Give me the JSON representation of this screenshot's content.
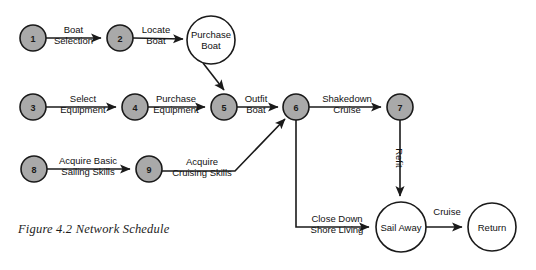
{
  "figure": {
    "caption": "Figure 4.2 Network Schedule",
    "colors": {
      "node_fill_gray": "#a9a9a9",
      "node_fill_white": "#ffffff",
      "stroke": "#1a1a1a",
      "background": "#ffffff"
    }
  },
  "nodes": [
    {
      "id": "n1",
      "label": "1",
      "kind": "milestone",
      "cx": 33,
      "cy": 38,
      "r": 13
    },
    {
      "id": "n2",
      "label": "2",
      "kind": "milestone",
      "cx": 120,
      "cy": 38,
      "r": 13
    },
    {
      "id": "n_purchase_boat",
      "label_line1": "Purchase",
      "label_line2": "Boat",
      "kind": "activity",
      "cx": 211,
      "cy": 40,
      "r": 24
    },
    {
      "id": "n3",
      "label": "3",
      "kind": "milestone",
      "cx": 33,
      "cy": 107,
      "r": 13
    },
    {
      "id": "n4",
      "label": "4",
      "kind": "milestone",
      "cx": 135,
      "cy": 107,
      "r": 13
    },
    {
      "id": "n5",
      "label": "5",
      "kind": "milestone",
      "cx": 224,
      "cy": 107,
      "r": 13
    },
    {
      "id": "n6",
      "label": "6",
      "kind": "milestone",
      "cx": 296,
      "cy": 107,
      "r": 13
    },
    {
      "id": "n7",
      "label": "7",
      "kind": "milestone",
      "cx": 400,
      "cy": 107,
      "r": 13
    },
    {
      "id": "n8",
      "label": "8",
      "kind": "milestone",
      "cx": 34,
      "cy": 169,
      "r": 13
    },
    {
      "id": "n9",
      "label": "9",
      "kind": "milestone",
      "cx": 149,
      "cy": 169,
      "r": 13
    },
    {
      "id": "n_sail_away",
      "label_line1": "Sail Away",
      "kind": "activity",
      "cx": 401,
      "cy": 227,
      "r": 25
    },
    {
      "id": "n_return",
      "label_line1": "Return",
      "kind": "activity",
      "cx": 492,
      "cy": 227,
      "r": 24
    }
  ],
  "edges": [
    {
      "id": "e1",
      "from": "n1",
      "to": "n2",
      "label_line1": "Boat",
      "label_line2": "Selection"
    },
    {
      "id": "e2",
      "from": "n2",
      "to": "n_purchase_boat",
      "label_line1": "Locate",
      "label_line2": "Boat"
    },
    {
      "id": "e3",
      "from": "n_purchase_boat",
      "to": "n5",
      "label_line1": "",
      "label_line2": ""
    },
    {
      "id": "e4",
      "from": "n3",
      "to": "n4",
      "label_line1": "Select",
      "label_line2": "Equipment"
    },
    {
      "id": "e5",
      "from": "n4",
      "to": "n5",
      "label_line1": "Purchase",
      "label_line2": "Equipment"
    },
    {
      "id": "e6",
      "from": "n5",
      "to": "n6",
      "label_line1": "Outfit",
      "label_line2": "Boat"
    },
    {
      "id": "e7",
      "from": "n6",
      "to": "n7",
      "label_line1": "Shakedown",
      "label_line2": "Cruise"
    },
    {
      "id": "e8",
      "from": "n8",
      "to": "n9",
      "label_line1": "Acquire Basic",
      "label_line2": "Sailing Skills"
    },
    {
      "id": "e9",
      "from": "n9",
      "to": "n6",
      "label_line1": "Acquire",
      "label_line2": "Cruising Skills"
    },
    {
      "id": "e10",
      "from": "n7",
      "to": "n_sail_away",
      "label_line1": "Refit",
      "rotated": true
    },
    {
      "id": "e11",
      "from": "n6",
      "to": "n_sail_away",
      "label_line1": "Close Down",
      "label_line2": "Shore Living"
    },
    {
      "id": "e12",
      "from": "n_sail_away",
      "to": "n_return",
      "label_line1": "Cruise",
      "label_line2": ""
    }
  ]
}
